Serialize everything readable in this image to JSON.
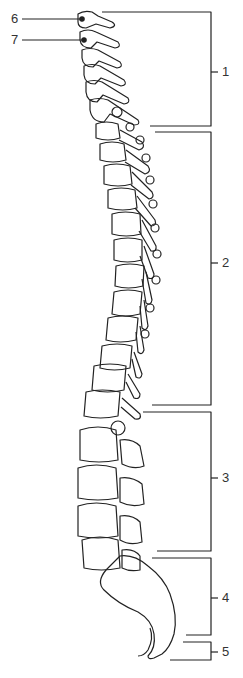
{
  "diagram": {
    "region_labels": [
      {
        "id": "1",
        "text": "1",
        "y_top": 12,
        "y_bottom": 126,
        "label_y": 72
      },
      {
        "id": "2",
        "text": "2",
        "y_top": 132,
        "y_bottom": 405,
        "label_y": 263
      },
      {
        "id": "3",
        "text": "3",
        "y_top": 412,
        "y_bottom": 551,
        "label_y": 478
      },
      {
        "id": "4",
        "text": "4",
        "y_top": 558,
        "y_bottom": 635,
        "label_y": 598
      },
      {
        "id": "5",
        "text": "5",
        "y_top": 642,
        "y_bottom": 660,
        "label_y": 652
      }
    ],
    "pointer_labels": [
      {
        "id": "6",
        "text": "6",
        "y": 19
      },
      {
        "id": "7",
        "text": "7",
        "y": 40
      }
    ],
    "line_color": "#222222"
  }
}
